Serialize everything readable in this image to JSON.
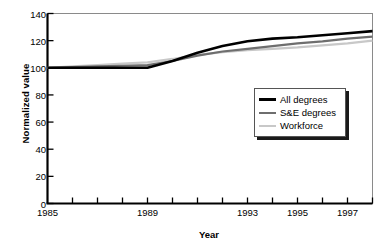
{
  "chart_data": {
    "type": "line",
    "title": "",
    "xlabel": "Year",
    "ylabel": "Normalized value",
    "xlim": [
      1985,
      1998
    ],
    "ylim": [
      0,
      140
    ],
    "grid": false,
    "legend_position": "center-right",
    "y_ticks": [
      0,
      20,
      40,
      60,
      80,
      100,
      120,
      140
    ],
    "y_tick_labels": [
      "0",
      "20",
      "40",
      "60",
      "80",
      "100",
      "120",
      "140"
    ],
    "x_ticks": [
      1985,
      1986,
      1987,
      1988,
      1989,
      1990,
      1991,
      1992,
      1993,
      1994,
      1995,
      1996,
      1997,
      1998
    ],
    "x_tick_labels": [
      "1985",
      "",
      "",
      "",
      "1989",
      "",
      "",
      "",
      "1993",
      "",
      "1995",
      "",
      "1997",
      ""
    ],
    "x_labeled_ticks": [
      {
        "x": 1985,
        "label": "1985"
      },
      {
        "x": 1989,
        "label": "1989"
      },
      {
        "x": 1993,
        "label": "1993"
      },
      {
        "x": 1995,
        "label": "1995"
      },
      {
        "x": 1997,
        "label": "1997"
      }
    ],
    "x": [
      1985,
      1986,
      1987,
      1988,
      1989,
      1990,
      1991,
      1992,
      1993,
      1994,
      1995,
      1996,
      1997,
      1998
    ],
    "series": [
      {
        "name": "All degrees",
        "color": "#000000",
        "width": 2.6,
        "values": [
          100,
          100,
          100,
          100,
          100,
          105,
          111,
          116,
          119.5,
          121.5,
          122.5,
          124,
          125.5,
          127
        ]
      },
      {
        "name": "S&E degrees",
        "color": "#6e6e6e",
        "width": 2.2,
        "values": [
          100,
          100.5,
          101,
          101.5,
          102,
          105,
          109,
          112,
          114,
          116,
          118,
          119.5,
          121.5,
          123
        ]
      },
      {
        "name": "Workforce",
        "color": "#c8c8c8",
        "width": 2.2,
        "values": [
          100,
          101,
          102,
          103,
          104,
          106.5,
          109.5,
          111.5,
          113,
          114,
          115,
          116.5,
          118,
          120
        ]
      }
    ]
  },
  "legend": {
    "entries": [
      {
        "label": "All degrees"
      },
      {
        "label": "S&E degrees"
      },
      {
        "label": "Workforce"
      }
    ]
  }
}
